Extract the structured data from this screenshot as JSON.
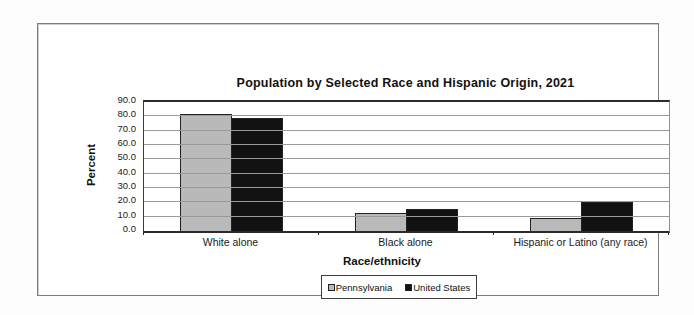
{
  "chart": {
    "title": "Population by Selected Race and Hispanic Origin, 2021",
    "y_axis_title": "Percent",
    "x_axis_title": "Race/ethnicity"
  },
  "legend": {
    "items": [
      {
        "label": "Pennsylvania",
        "color": "#b9b9b9"
      },
      {
        "label": "United States",
        "color": "#121212"
      }
    ]
  },
  "chart_data": {
    "type": "bar",
    "title": "Population by Selected Race and Hispanic Origin, 2021",
    "xlabel": "Race/ethnicity",
    "ylabel": "Percent",
    "categories": [
      "White alone",
      "Black alone",
      "Hispanic or Latino (any race)"
    ],
    "series": [
      {
        "name": "Pennsylvania",
        "color": "#b9b9b9",
        "values": [
          81.5,
          12.5,
          9.0
        ]
      },
      {
        "name": "United States",
        "color": "#121212",
        "values": [
          78.5,
          15.5,
          20.5
        ]
      }
    ],
    "ylim": [
      0,
      90
    ],
    "ytick_step": 10,
    "ytick_labels": [
      "0.0",
      "10.0",
      "20.0",
      "30.0",
      "40.0",
      "50.0",
      "60.0",
      "70.0",
      "80.0",
      "90.0"
    ],
    "grid": "horizontal",
    "legend_position": "bottom"
  }
}
